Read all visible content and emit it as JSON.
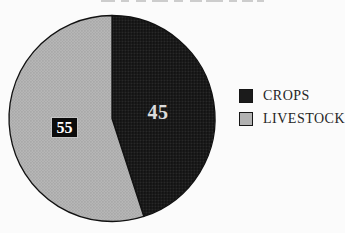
{
  "chart_data": {
    "type": "pie",
    "title": "",
    "slices": [
      {
        "label": "CROPS",
        "value": 45,
        "color": "#1b1b1b",
        "pattern": "halftone-dark",
        "value_label_color": "#dcdcdc"
      },
      {
        "label": "LIVESTOCK",
        "value": 55,
        "color": "#b2b2b2",
        "pattern": "halftone-gray",
        "value_label_color": "#ffffff"
      }
    ],
    "start_angle_deg": 0,
    "direction": "clockwise",
    "legend_position": "right",
    "data_labels_shown": true
  },
  "colors": {
    "background": "#fbfbfb",
    "slice_outline": "#111111",
    "legend_text": "#262626",
    "value_box_background": "#0c0c0c"
  }
}
